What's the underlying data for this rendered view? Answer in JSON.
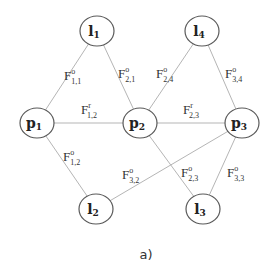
{
  "caption": "a)",
  "colors": {
    "edge": "#b5b5b5",
    "node_stroke": "#5a5a5a",
    "text": "#222222",
    "background": "#ffffff"
  },
  "nodes": [
    {
      "id": "l1",
      "base": "l",
      "sub": "1",
      "x": 97,
      "y": 31
    },
    {
      "id": "l4",
      "base": "l",
      "sub": "4",
      "x": 202,
      "y": 31
    },
    {
      "id": "p1",
      "base": "p",
      "sub": "1",
      "x": 37,
      "y": 123
    },
    {
      "id": "p2",
      "base": "p",
      "sub": "2",
      "x": 140,
      "y": 123
    },
    {
      "id": "p3",
      "base": "p",
      "sub": "3",
      "x": 242,
      "y": 123
    },
    {
      "id": "l2",
      "base": "l",
      "sub": "2",
      "x": 96,
      "y": 209
    },
    {
      "id": "l3",
      "base": "l",
      "sub": "3",
      "x": 203,
      "y": 209
    }
  ],
  "edges": [
    {
      "from": "p1",
      "to": "l1",
      "label": {
        "base": "F",
        "sup": "o",
        "sub": "1,1",
        "x": 64,
        "y": 80
      }
    },
    {
      "from": "l1",
      "to": "p2",
      "label": {
        "base": "F",
        "sup": "o",
        "sub": "2,1",
        "x": 118,
        "y": 78
      }
    },
    {
      "from": "p2",
      "to": "l4",
      "label": {
        "base": "F",
        "sup": "o",
        "sub": "2,4",
        "x": 156,
        "y": 78
      }
    },
    {
      "from": "l4",
      "to": "p3",
      "label": {
        "base": "F",
        "sup": "o",
        "sub": "3,4",
        "x": 225,
        "y": 78
      }
    },
    {
      "from": "p1",
      "to": "p2",
      "label": {
        "base": "F",
        "sup": "r",
        "sub": "1,2",
        "x": 81,
        "y": 114
      }
    },
    {
      "from": "p2",
      "to": "p3",
      "label": {
        "base": "F",
        "sup": "r",
        "sub": "2,3",
        "x": 183,
        "y": 114
      }
    },
    {
      "from": "p1",
      "to": "l2",
      "label": {
        "base": "F",
        "sup": "o",
        "sub": "1,2",
        "x": 63,
        "y": 161
      }
    },
    {
      "from": "l2",
      "to": "p3",
      "label": {
        "base": "F",
        "sup": "o",
        "sub": "3,2",
        "x": 122,
        "y": 179
      }
    },
    {
      "from": "p2",
      "to": "l3",
      "label": {
        "base": "F",
        "sup": "o",
        "sub": "2,3",
        "x": 181,
        "y": 177
      }
    },
    {
      "from": "p3",
      "to": "l3",
      "label": {
        "base": "F",
        "sup": "o",
        "sub": "3,3",
        "x": 227,
        "y": 177
      }
    }
  ]
}
